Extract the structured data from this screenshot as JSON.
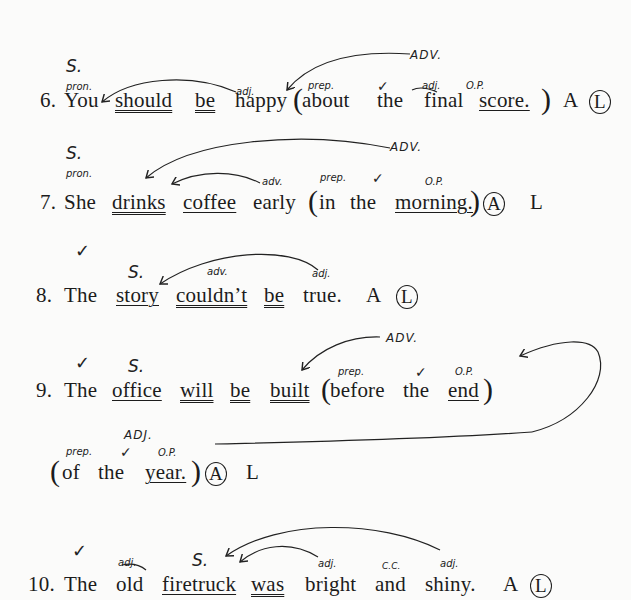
{
  "exercise": {
    "choices": [
      "A",
      "L"
    ],
    "sentences": [
      {
        "number": "6.",
        "words": [
          "You",
          "should",
          "be",
          "happy",
          "about",
          "the",
          "final",
          "score."
        ],
        "answer_circled": "L",
        "annotations": {
          "subject": "S.",
          "pron": "pron.",
          "adj": "adj.",
          "prep": "prep.",
          "check": "✓",
          "adj2": "adj.",
          "op": "O.P.",
          "phrase": "ADV."
        }
      },
      {
        "number": "7.",
        "words": [
          "She",
          "drinks",
          "coffee",
          "early",
          "in",
          "the",
          "morning."
        ],
        "answer_circled": "A",
        "annotations": {
          "subject": "S.",
          "pron": "pron.",
          "adv": "adv.",
          "prep": "prep.",
          "check": "✓",
          "op": "O.P.",
          "phrase": "ADV."
        }
      },
      {
        "number": "8.",
        "words": [
          "The",
          "story",
          "couldn’t",
          "be",
          "true."
        ],
        "answer_circled": "L",
        "annotations": {
          "check": "✓",
          "subject": "S.",
          "adv": "adv.",
          "adj": "adj."
        }
      },
      {
        "number": "9.",
        "words": [
          "The",
          "office",
          "will",
          "be",
          "built",
          "before",
          "the",
          "end"
        ],
        "continuation": [
          "of",
          "the",
          "year."
        ],
        "answer_circled": "A",
        "annotations": {
          "check": "✓",
          "subject": "S.",
          "prep": "prep.",
          "check2": "✓",
          "op": "O.P.",
          "phrase": "ADV.",
          "phrase2": "ADJ.",
          "prep2": "prep.",
          "check3": "✓",
          "op2": "O.P."
        }
      },
      {
        "number": "10.",
        "words": [
          "The",
          "old",
          "firetruck",
          "was",
          "bright",
          "and",
          "shiny."
        ],
        "answer_circled": "L",
        "annotations": {
          "check": "✓",
          "adj": "adj.",
          "subject": "S.",
          "adj2": "adj.",
          "cc": "C.C.",
          "adj3": "adj."
        }
      }
    ]
  }
}
